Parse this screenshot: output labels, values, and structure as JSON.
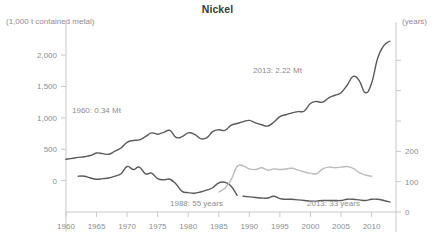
{
  "chart_data": {
    "type": "line",
    "title": "Nickel",
    "xlabel": "",
    "ylabel": "(1,000 t contained metal)",
    "ylabel_right": "(years)",
    "xlim": [
      1960,
      2014
    ],
    "ylim": [
      -500,
      2400
    ],
    "ylim_right": [
      0,
      600
    ],
    "grid": false,
    "legend_position": "none",
    "y_ticks_left": [
      "0",
      "500",
      "1,000",
      "1,500",
      "2,000"
    ],
    "y_tick_values_left": [
      0,
      500,
      1000,
      1500,
      2000
    ],
    "y_ticks_right": [
      "0",
      "100",
      "200"
    ],
    "y_tick_values_right": [
      0,
      100,
      200
    ],
    "y_tick_values_right_unlabeled": [
      300,
      400,
      500
    ],
    "x_ticks": [
      "1960",
      "1965",
      "1970",
      "1975",
      "1980",
      "1985",
      "1990",
      "1995",
      "2000",
      "2005",
      "2010"
    ],
    "x_tick_values": [
      1960,
      1965,
      1970,
      1975,
      1980,
      1985,
      1990,
      1995,
      2000,
      2005,
      2010
    ],
    "annotations": [
      {
        "id": "production-start",
        "text": "1960: 0.34 Mt",
        "x": 72,
        "y": 106
      },
      {
        "id": "production-end",
        "text": "2013: 2.22 Mt",
        "x": 253,
        "y": 66
      },
      {
        "id": "reserve-life-1988",
        "text": "1988: 55 years",
        "x": 170,
        "y": 199
      },
      {
        "id": "reserve-life-2013",
        "text": "2013: 33 years",
        "x": 307,
        "y": 199
      }
    ],
    "series": [
      {
        "name": "Mine production",
        "axis": "left",
        "color": "#5a5a5a",
        "x": [
          1960,
          1961,
          1962,
          1963,
          1964,
          1965,
          1966,
          1967,
          1968,
          1969,
          1970,
          1971,
          1972,
          1973,
          1974,
          1975,
          1976,
          1977,
          1978,
          1979,
          1980,
          1981,
          1982,
          1983,
          1984,
          1985,
          1986,
          1987,
          1988,
          1989,
          1990,
          1991,
          1992,
          1993,
          1994,
          1995,
          1996,
          1997,
          1998,
          1999,
          2000,
          2001,
          2002,
          2003,
          2004,
          2005,
          2006,
          2007,
          2008,
          2009,
          2010,
          2011,
          2012,
          2013
        ],
        "values": [
          340,
          355,
          370,
          380,
          400,
          440,
          430,
          420,
          470,
          520,
          610,
          640,
          650,
          700,
          760,
          740,
          770,
          800,
          690,
          700,
          760,
          740,
          670,
          680,
          780,
          810,
          800,
          880,
          910,
          940,
          960,
          920,
          890,
          870,
          930,
          1020,
          1050,
          1080,
          1100,
          1110,
          1230,
          1260,
          1250,
          1320,
          1360,
          1400,
          1520,
          1660,
          1590,
          1400,
          1550,
          1950,
          2150,
          2220
        ]
      },
      {
        "name": "Reserve life (early)",
        "axis": "right",
        "color": "#5a5a5a",
        "x": [
          1962,
          1963,
          1964,
          1965,
          1966,
          1967,
          1968,
          1969,
          1970,
          1971,
          1972,
          1973,
          1974,
          1975,
          1976,
          1977,
          1978,
          1979,
          1980,
          1981,
          1982,
          1983,
          1984,
          1985,
          1986,
          1987,
          1988
        ],
        "values": [
          118,
          118,
          112,
          108,
          110,
          112,
          118,
          126,
          150,
          140,
          148,
          126,
          128,
          110,
          106,
          108,
          92,
          68,
          64,
          62,
          66,
          72,
          80,
          96,
          98,
          86,
          55
        ]
      },
      {
        "name": "Reserve life (late, light)",
        "axis": "right",
        "color": "#bcbcbc",
        "x": [
          1985,
          1986,
          1987,
          1988,
          1989,
          1990,
          1991,
          1992,
          1993,
          1994,
          1995,
          1996,
          1997,
          1998,
          1999,
          2000,
          2001,
          2002,
          2003,
          2004,
          2005,
          2006,
          2007,
          2008,
          2009,
          2010
        ],
        "values": [
          66,
          78,
          106,
          150,
          152,
          142,
          140,
          146,
          138,
          142,
          140,
          142,
          144,
          138,
          132,
          128,
          126,
          142,
          148,
          146,
          148,
          150,
          144,
          130,
          122,
          118
        ]
      },
      {
        "name": "Reserve life (current)",
        "axis": "right",
        "color": "#5a5a5a",
        "x": [
          1989,
          1990,
          1991,
          1992,
          1993,
          1994,
          1995,
          1996,
          1997,
          1998,
          1999,
          2000,
          2001,
          2002,
          2003,
          2004,
          2005,
          2006,
          2007,
          2008,
          2009,
          2010,
          2011,
          2012,
          2013
        ],
        "values": [
          52,
          50,
          48,
          46,
          46,
          52,
          44,
          42,
          42,
          40,
          38,
          36,
          36,
          38,
          38,
          38,
          38,
          42,
          42,
          40,
          38,
          42,
          42,
          38,
          33
        ]
      }
    ]
  }
}
